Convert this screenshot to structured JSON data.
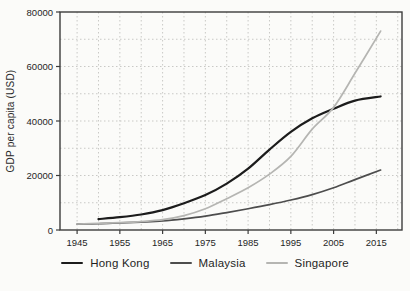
{
  "chart_data": {
    "type": "line",
    "title": "",
    "xlabel": "",
    "ylabel": "GDP per capita (USD)",
    "xlim": [
      1941,
      2021
    ],
    "ylim": [
      0,
      80000
    ],
    "x_tick_labels": [
      1945,
      1955,
      1965,
      1975,
      1985,
      1995,
      2005,
      2015
    ],
    "y_tick_labels": [
      0,
      20000,
      40000,
      60000,
      80000
    ],
    "grid": {
      "on": true,
      "x_interval_years": 5,
      "y_interval": 10000,
      "style": "dotted"
    },
    "legend_position": "bottom",
    "series": [
      {
        "name": "Hong Kong",
        "color": "#1c1c1c",
        "stroke_width": 2.2,
        "points": [
          [
            1950,
            4000
          ],
          [
            1955,
            4700
          ],
          [
            1960,
            5700
          ],
          [
            1965,
            7300
          ],
          [
            1970,
            9800
          ],
          [
            1975,
            12800
          ],
          [
            1980,
            17000
          ],
          [
            1985,
            22500
          ],
          [
            1990,
            29500
          ],
          [
            1995,
            36000
          ],
          [
            2000,
            41000
          ],
          [
            2005,
            44500
          ],
          [
            2010,
            47500
          ],
          [
            2016,
            49000
          ]
        ]
      },
      {
        "name": "Malaysia",
        "color": "#4d4d4d",
        "stroke_width": 1.7,
        "points": [
          [
            1945,
            2200
          ],
          [
            1950,
            2300
          ],
          [
            1955,
            2600
          ],
          [
            1960,
            2900
          ],
          [
            1965,
            3300
          ],
          [
            1970,
            4100
          ],
          [
            1975,
            5100
          ],
          [
            1980,
            6400
          ],
          [
            1985,
            7800
          ],
          [
            1990,
            9300
          ],
          [
            1995,
            11000
          ],
          [
            2000,
            13000
          ],
          [
            2005,
            15500
          ],
          [
            2010,
            18500
          ],
          [
            2016,
            22000
          ]
        ]
      },
      {
        "name": "Singapore",
        "color": "#b5b5b2",
        "stroke_width": 1.7,
        "points": [
          [
            1945,
            2200
          ],
          [
            1950,
            2400
          ],
          [
            1955,
            2700
          ],
          [
            1960,
            3100
          ],
          [
            1965,
            3800
          ],
          [
            1970,
            5300
          ],
          [
            1975,
            7800
          ],
          [
            1980,
            11500
          ],
          [
            1985,
            15500
          ],
          [
            1990,
            20500
          ],
          [
            1995,
            27000
          ],
          [
            2000,
            37000
          ],
          [
            2005,
            45000
          ],
          [
            2010,
            57500
          ],
          [
            2016,
            73000
          ]
        ]
      }
    ]
  },
  "style": {
    "background": "#fbfbf9",
    "frame_color": "#3c3c3c",
    "grid_color": "#c9c9c6",
    "tick_label_color": "#262626"
  }
}
